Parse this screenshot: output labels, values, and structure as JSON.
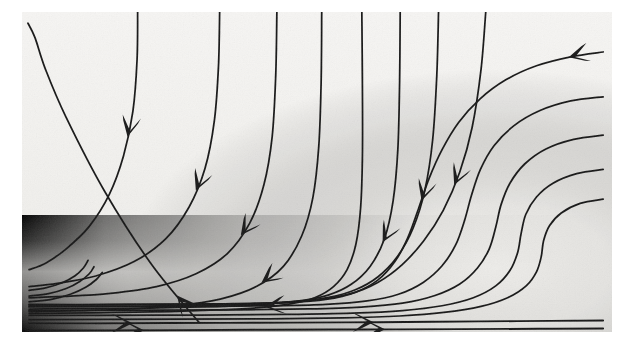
{
  "figure": {
    "title": "Streamline flow field with boundary layer and recirculation",
    "caption": "",
    "background_color": "#ffffff",
    "paper_color": "#f2f1ee",
    "ink_color": "#1a1a1a",
    "shade_dark_color": "#0a0a0a",
    "shade_mid_color": "#6e6e6e",
    "shade_light_color": "#e9e8e5"
  },
  "plot_area": {
    "x": 22,
    "y": 12,
    "width": 590,
    "height": 320,
    "border": "none"
  },
  "chart_data": {
    "type": "line",
    "subtype": "streamline-vector-field",
    "title": "Streamline flow field with boundary layer and recirculation",
    "xlabel": "",
    "ylabel": "",
    "xlim": [
      0,
      1
    ],
    "ylim": [
      0,
      1
    ],
    "grid": false,
    "legend": "none",
    "annotations": [],
    "tick_labels_x": [],
    "tick_labels_y": [],
    "shading": {
      "description": "dark scalar field concentrated in lower-right quadrant fading up and left",
      "hotspot_x": 0.82,
      "hotspot_y": 0.78,
      "min_value": 0.0,
      "max_value": 1.0
    },
    "series": [
      {
        "name": "streamline-1",
        "direction": "up-left",
        "arrow_t": [
          0.1
        ],
        "points": [
          [
            0.3,
            0.97
          ],
          [
            0.22,
            0.79
          ],
          [
            0.14,
            0.56
          ],
          [
            0.075,
            0.33
          ],
          [
            0.04,
            0.18
          ],
          [
            0.022,
            0.08
          ],
          [
            0.01,
            0.035
          ]
        ]
      },
      {
        "name": "streamline-2",
        "direction": "down",
        "arrow_t": [
          0.42
        ],
        "points": [
          [
            0.196,
            0.0
          ],
          [
            0.195,
            0.15
          ],
          [
            0.188,
            0.31
          ],
          [
            0.172,
            0.45
          ],
          [
            0.148,
            0.57
          ],
          [
            0.114,
            0.67
          ],
          [
            0.075,
            0.74
          ],
          [
            0.04,
            0.785
          ],
          [
            0.012,
            0.805
          ]
        ]
      },
      {
        "name": "streamline-3",
        "direction": "down",
        "arrow_t": [
          0.47
        ],
        "points": [
          [
            0.335,
            0.0
          ],
          [
            0.333,
            0.17
          ],
          [
            0.326,
            0.34
          ],
          [
            0.31,
            0.49
          ],
          [
            0.283,
            0.61
          ],
          [
            0.243,
            0.71
          ],
          [
            0.19,
            0.78
          ],
          [
            0.125,
            0.825
          ],
          [
            0.06,
            0.848
          ],
          [
            0.012,
            0.858
          ]
        ]
      },
      {
        "name": "streamline-4",
        "direction": "down",
        "arrow_t": [
          0.5
        ],
        "points": [
          [
            0.432,
            0.0
          ],
          [
            0.43,
            0.2
          ],
          [
            0.424,
            0.39
          ],
          [
            0.41,
            0.54
          ],
          [
            0.386,
            0.66
          ],
          [
            0.348,
            0.755
          ],
          [
            0.295,
            0.818
          ],
          [
            0.228,
            0.858
          ],
          [
            0.15,
            0.879
          ],
          [
            0.07,
            0.889
          ],
          [
            0.012,
            0.893
          ]
        ]
      },
      {
        "name": "streamline-5",
        "direction": "down",
        "arrow_t": [
          0.55
        ],
        "points": [
          [
            0.508,
            0.0
          ],
          [
            0.507,
            0.22
          ],
          [
            0.503,
            0.42
          ],
          [
            0.493,
            0.58
          ],
          [
            0.474,
            0.7
          ],
          [
            0.443,
            0.795
          ],
          [
            0.398,
            0.857
          ],
          [
            0.336,
            0.897
          ],
          [
            0.26,
            0.918
          ],
          [
            0.17,
            0.929
          ],
          [
            0.075,
            0.934
          ],
          [
            0.012,
            0.936
          ]
        ]
      },
      {
        "name": "streamline-6",
        "direction": "down-right",
        "arrow_t": [
          0.6
        ],
        "points": [
          [
            0.576,
            0.0
          ],
          [
            0.577,
            0.24
          ],
          [
            0.577,
            0.45
          ],
          [
            0.574,
            0.61
          ],
          [
            0.566,
            0.725
          ],
          [
            0.551,
            0.805
          ],
          [
            0.528,
            0.858
          ],
          [
            0.497,
            0.892
          ],
          [
            0.455,
            0.912
          ],
          [
            0.4,
            0.924
          ],
          [
            0.33,
            0.931
          ],
          [
            0.25,
            0.936
          ],
          [
            0.16,
            0.939
          ],
          [
            0.06,
            0.941
          ],
          [
            0.012,
            0.942
          ]
        ]
      },
      {
        "name": "streamline-7",
        "direction": "down-left",
        "arrow_t": [
          0.38
        ],
        "points": [
          [
            0.641,
            0.0
          ],
          [
            0.64,
            0.22
          ],
          [
            0.637,
            0.43
          ],
          [
            0.629,
            0.59
          ],
          [
            0.614,
            0.71
          ],
          [
            0.59,
            0.795
          ],
          [
            0.558,
            0.851
          ],
          [
            0.52,
            0.884
          ],
          [
            0.47,
            0.903
          ],
          [
            0.4,
            0.915
          ],
          [
            0.32,
            0.921
          ],
          [
            0.23,
            0.925
          ],
          [
            0.13,
            0.927
          ],
          [
            0.04,
            0.928
          ],
          [
            0.012,
            0.929
          ]
        ]
      },
      {
        "name": "streamline-8",
        "direction": "down-left",
        "arrow_t": [
          0.3
        ],
        "points": [
          [
            0.706,
            0.0
          ],
          [
            0.703,
            0.2
          ],
          [
            0.696,
            0.4
          ],
          [
            0.683,
            0.555
          ],
          [
            0.663,
            0.675
          ],
          [
            0.636,
            0.765
          ],
          [
            0.603,
            0.828
          ],
          [
            0.565,
            0.868
          ],
          [
            0.52,
            0.892
          ],
          [
            0.462,
            0.906
          ],
          [
            0.39,
            0.913
          ],
          [
            0.3,
            0.917
          ],
          [
            0.2,
            0.919
          ],
          [
            0.09,
            0.92
          ],
          [
            0.012,
            0.921
          ]
        ]
      },
      {
        "name": "streamline-9",
        "direction": "down-left",
        "arrow_t": [
          0.27
        ],
        "points": [
          [
            0.786,
            0.0
          ],
          [
            0.778,
            0.18
          ],
          [
            0.763,
            0.36
          ],
          [
            0.742,
            0.5
          ],
          [
            0.714,
            0.62
          ],
          [
            0.681,
            0.715
          ],
          [
            0.644,
            0.79
          ],
          [
            0.603,
            0.845
          ],
          [
            0.557,
            0.88
          ],
          [
            0.5,
            0.899
          ],
          [
            0.43,
            0.908
          ],
          [
            0.34,
            0.912
          ],
          [
            0.23,
            0.914
          ],
          [
            0.11,
            0.915
          ],
          [
            0.012,
            0.916
          ]
        ]
      },
      {
        "name": "streamline-10",
        "direction": "left",
        "arrow_t": [
          0.05
        ],
        "points": [
          [
            0.985,
            0.125
          ],
          [
            0.93,
            0.14
          ],
          [
            0.872,
            0.168
          ],
          [
            0.82,
            0.212
          ],
          [
            0.776,
            0.272
          ],
          [
            0.74,
            0.345
          ],
          [
            0.712,
            0.43
          ],
          [
            0.69,
            0.52
          ],
          [
            0.672,
            0.615
          ],
          [
            0.654,
            0.705
          ],
          [
            0.632,
            0.78
          ],
          [
            0.603,
            0.838
          ],
          [
            0.565,
            0.876
          ],
          [
            0.515,
            0.898
          ],
          [
            0.45,
            0.908
          ],
          [
            0.37,
            0.912
          ],
          [
            0.27,
            0.913
          ],
          [
            0.15,
            0.914
          ],
          [
            0.012,
            0.914
          ]
        ]
      },
      {
        "name": "streamline-11",
        "direction": "left",
        "arrow_t": [],
        "points": [
          [
            0.985,
            0.265
          ],
          [
            0.93,
            0.278
          ],
          [
            0.878,
            0.308
          ],
          [
            0.834,
            0.355
          ],
          [
            0.8,
            0.418
          ],
          [
            0.777,
            0.492
          ],
          [
            0.762,
            0.572
          ],
          [
            0.75,
            0.652
          ],
          [
            0.735,
            0.728
          ],
          [
            0.712,
            0.793
          ],
          [
            0.68,
            0.845
          ],
          [
            0.638,
            0.882
          ],
          [
            0.585,
            0.903
          ],
          [
            0.515,
            0.914
          ],
          [
            0.43,
            0.918
          ],
          [
            0.32,
            0.92
          ],
          [
            0.18,
            0.921
          ],
          [
            0.012,
            0.921
          ]
        ]
      },
      {
        "name": "streamline-12",
        "direction": "left",
        "arrow_t": [],
        "points": [
          [
            0.985,
            0.385
          ],
          [
            0.935,
            0.398
          ],
          [
            0.888,
            0.428
          ],
          [
            0.852,
            0.475
          ],
          [
            0.827,
            0.535
          ],
          [
            0.812,
            0.602
          ],
          [
            0.803,
            0.672
          ],
          [
            0.792,
            0.74
          ],
          [
            0.772,
            0.8
          ],
          [
            0.742,
            0.85
          ],
          [
            0.7,
            0.886
          ],
          [
            0.645,
            0.91
          ],
          [
            0.575,
            0.922
          ],
          [
            0.485,
            0.928
          ],
          [
            0.37,
            0.931
          ],
          [
            0.22,
            0.932
          ],
          [
            0.012,
            0.933
          ]
        ]
      },
      {
        "name": "streamline-13",
        "direction": "left",
        "arrow_t": [],
        "points": [
          [
            0.985,
            0.492
          ],
          [
            0.94,
            0.505
          ],
          [
            0.9,
            0.535
          ],
          [
            0.872,
            0.578
          ],
          [
            0.854,
            0.632
          ],
          [
            0.846,
            0.692
          ],
          [
            0.84,
            0.752
          ],
          [
            0.827,
            0.808
          ],
          [
            0.803,
            0.856
          ],
          [
            0.765,
            0.893
          ],
          [
            0.712,
            0.918
          ],
          [
            0.645,
            0.933
          ],
          [
            0.56,
            0.941
          ],
          [
            0.45,
            0.945
          ],
          [
            0.3,
            0.947
          ],
          [
            0.12,
            0.948
          ],
          [
            0.012,
            0.948
          ]
        ]
      },
      {
        "name": "streamline-14",
        "direction": "left",
        "arrow_t": [],
        "points": [
          [
            0.985,
            0.585
          ],
          [
            0.946,
            0.598
          ],
          [
            0.914,
            0.628
          ],
          [
            0.894,
            0.668
          ],
          [
            0.884,
            0.715
          ],
          [
            0.88,
            0.765
          ],
          [
            0.872,
            0.812
          ],
          [
            0.855,
            0.855
          ],
          [
            0.824,
            0.892
          ],
          [
            0.778,
            0.92
          ],
          [
            0.715,
            0.939
          ],
          [
            0.64,
            0.95
          ],
          [
            0.545,
            0.956
          ],
          [
            0.42,
            0.959
          ],
          [
            0.26,
            0.96
          ],
          [
            0.012,
            0.961
          ]
        ]
      },
      {
        "name": "streamline-15",
        "direction": "right",
        "arrow_t": [
          0.18,
          0.6
        ],
        "points": [
          [
            0.012,
            0.973
          ],
          [
            0.12,
            0.973
          ],
          [
            0.25,
            0.972
          ],
          [
            0.4,
            0.971
          ],
          [
            0.55,
            0.97
          ],
          [
            0.7,
            0.968
          ],
          [
            0.84,
            0.966
          ],
          [
            0.985,
            0.964
          ]
        ]
      },
      {
        "name": "streamline-16",
        "direction": "right",
        "arrow_t": [
          0.2,
          0.62
        ],
        "points": [
          [
            0.012,
            0.995
          ],
          [
            0.13,
            0.995
          ],
          [
            0.27,
            0.994
          ],
          [
            0.42,
            0.993
          ],
          [
            0.58,
            0.992
          ],
          [
            0.74,
            0.991
          ],
          [
            0.88,
            0.99
          ],
          [
            0.985,
            0.989
          ]
        ]
      },
      {
        "name": "streamline-17-inner-corner",
        "direction": "right",
        "arrow_t": [],
        "points": [
          [
            0.012,
            0.87
          ],
          [
            0.04,
            0.862
          ],
          [
            0.068,
            0.846
          ],
          [
            0.09,
            0.824
          ],
          [
            0.104,
            0.8
          ],
          [
            0.112,
            0.776
          ]
        ]
      },
      {
        "name": "streamline-18-inner-corner",
        "direction": "right",
        "arrow_t": [],
        "points": [
          [
            0.012,
            0.888
          ],
          [
            0.045,
            0.88
          ],
          [
            0.075,
            0.864
          ],
          [
            0.098,
            0.842
          ],
          [
            0.114,
            0.818
          ],
          [
            0.122,
            0.796
          ]
        ]
      },
      {
        "name": "streamline-19-inner-corner",
        "direction": "right",
        "arrow_t": [],
        "points": [
          [
            0.012,
            0.906
          ],
          [
            0.05,
            0.898
          ],
          [
            0.082,
            0.882
          ],
          [
            0.108,
            0.86
          ],
          [
            0.126,
            0.836
          ],
          [
            0.136,
            0.814
          ]
        ]
      }
    ]
  },
  "labels": {
    "x_axis": "",
    "y_axis": "",
    "figure_number": ""
  }
}
